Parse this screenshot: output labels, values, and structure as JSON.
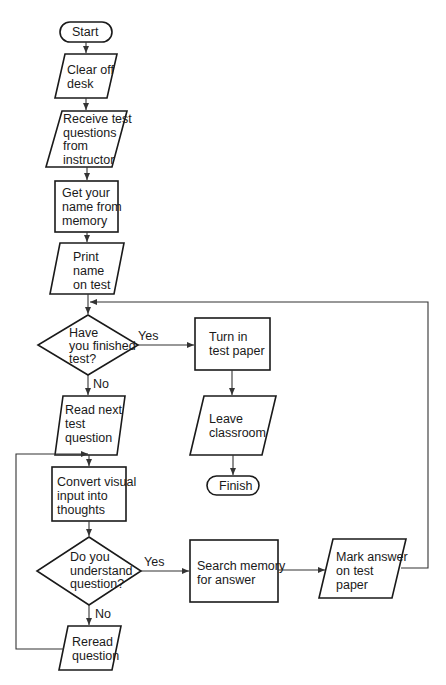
{
  "diagram": {
    "type": "flowchart",
    "colors": {
      "stroke": "#1a1a1a",
      "background": "#ffffff",
      "text": "#1a1a1a"
    },
    "nodes": {
      "start": {
        "shape": "terminator",
        "label": "Start"
      },
      "clear_desk": {
        "shape": "parallelogram",
        "label": "Clear off\ndesk"
      },
      "receive_questions": {
        "shape": "parallelogram",
        "label": "Receive test\nquestions\nfrom\ninstructor"
      },
      "get_name": {
        "shape": "rectangle",
        "label": "Get your\nname from\nmemory"
      },
      "print_name": {
        "shape": "parallelogram",
        "label": "Print\nname\non test"
      },
      "finished_test": {
        "shape": "diamond",
        "label": "Have\nyou finished\ntest?"
      },
      "turn_in": {
        "shape": "rectangle",
        "label": "Turn in\ntest paper"
      },
      "leave_classroom": {
        "shape": "parallelogram",
        "label": "Leave\nclassroom"
      },
      "finish": {
        "shape": "terminator",
        "label": "Finish"
      },
      "read_next": {
        "shape": "parallelogram",
        "label": "Read next\ntest\nquestion"
      },
      "convert_input": {
        "shape": "rectangle",
        "label": "Convert visual\ninput into\nthoughts"
      },
      "understand_question": {
        "shape": "diamond",
        "label": "Do you\nunderstand\nquestion?"
      },
      "search_memory": {
        "shape": "rectangle",
        "label": "Search memory\nfor answer"
      },
      "mark_answer": {
        "shape": "parallelogram",
        "label": "Mark answer\non test\npaper"
      },
      "reread": {
        "shape": "parallelogram",
        "label": "Reread\nquestion"
      }
    },
    "edges": [
      {
        "from": "start",
        "to": "clear_desk",
        "label": ""
      },
      {
        "from": "clear_desk",
        "to": "receive_questions",
        "label": ""
      },
      {
        "from": "receive_questions",
        "to": "get_name",
        "label": ""
      },
      {
        "from": "get_name",
        "to": "print_name",
        "label": ""
      },
      {
        "from": "print_name",
        "to": "finished_test",
        "label": ""
      },
      {
        "from": "finished_test",
        "to": "turn_in",
        "label": "Yes"
      },
      {
        "from": "finished_test",
        "to": "read_next",
        "label": "No"
      },
      {
        "from": "turn_in",
        "to": "leave_classroom",
        "label": ""
      },
      {
        "from": "leave_classroom",
        "to": "finish",
        "label": ""
      },
      {
        "from": "read_next",
        "to": "convert_input",
        "label": ""
      },
      {
        "from": "convert_input",
        "to": "understand_question",
        "label": ""
      },
      {
        "from": "understand_question",
        "to": "search_memory",
        "label": "Yes"
      },
      {
        "from": "understand_question",
        "to": "reread",
        "label": "No"
      },
      {
        "from": "search_memory",
        "to": "mark_answer",
        "label": ""
      },
      {
        "from": "mark_answer",
        "to": "finished_test",
        "label": ""
      },
      {
        "from": "reread",
        "to": "convert_input",
        "label": ""
      }
    ],
    "edge_labels": {
      "finished_yes": "Yes",
      "finished_no": "No",
      "understand_yes": "Yes",
      "understand_no": "No"
    }
  }
}
